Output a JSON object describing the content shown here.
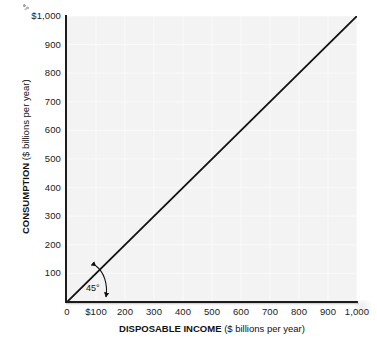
{
  "chart_data": {
    "type": "line",
    "title": "",
    "subtitle": "",
    "xlabel_bold": "DISPOSABLE INCOME",
    "xlabel_regular": "($ billions per year)",
    "ylabel_bold": "CONSUMPTION",
    "ylabel_regular": "($ billions per year)",
    "xlim": [
      0,
      1000
    ],
    "ylim": [
      0,
      1000
    ],
    "grid": true,
    "legend": "none",
    "x_ticks": [
      {
        "value": 0,
        "label": "0"
      },
      {
        "value": 100,
        "label": "$100"
      },
      {
        "value": 200,
        "label": "200"
      },
      {
        "value": 300,
        "label": "300"
      },
      {
        "value": 400,
        "label": "400"
      },
      {
        "value": 500,
        "label": "500"
      },
      {
        "value": 600,
        "label": "600"
      },
      {
        "value": 700,
        "label": "700"
      },
      {
        "value": 800,
        "label": "800"
      },
      {
        "value": 900,
        "label": "900"
      },
      {
        "value": 1000,
        "label": "1,000"
      }
    ],
    "y_ticks": [
      {
        "value": 100,
        "label": "100"
      },
      {
        "value": 200,
        "label": "200"
      },
      {
        "value": 300,
        "label": "300"
      },
      {
        "value": 400,
        "label": "400"
      },
      {
        "value": 500,
        "label": "500"
      },
      {
        "value": 600,
        "label": "600"
      },
      {
        "value": 700,
        "label": "700"
      },
      {
        "value": 800,
        "label": "800"
      },
      {
        "value": 900,
        "label": "900"
      },
      {
        "value": 1000,
        "label": "$1,000"
      }
    ],
    "series": [
      {
        "name": "45-degree line",
        "x": [
          0,
          1000
        ],
        "values": [
          0,
          1000
        ],
        "color": "#111111",
        "width": 1.8
      }
    ],
    "annotations": [
      {
        "name": "angle-45",
        "text": "45°",
        "x": 160,
        "y": 55,
        "description": "double-headed curved arrow between the 45-degree line and the horizontal axis"
      }
    ],
    "colors": {
      "plot_background": "#f3f3f3",
      "page_background": "#ffffff",
      "gridline": "#fbfbfb",
      "axis": "#1c1c1c",
      "line": "#111111",
      "text": "#1a1a1a"
    }
  }
}
